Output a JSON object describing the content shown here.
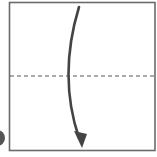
{
  "diagram": {
    "type": "origami-fold-step",
    "paper": {
      "shape": "square",
      "x": 9.5,
      "y": 2.5,
      "width": 145.5,
      "height": 148,
      "stroke": "#6b6b6b",
      "fill": "#ffffff"
    },
    "fold_line": {
      "style": "valley-dashed",
      "y": 76,
      "x1": 10,
      "x2": 155,
      "stroke": "#555555",
      "dash": "4 3"
    },
    "fold_arrow": {
      "direction": "top-to-bottom",
      "path": "M 79 7 Q 58 76 80 140",
      "stroke": "#444444",
      "head_tip": [
        81,
        147
      ]
    },
    "step_marker": {
      "partial": true,
      "cx": -3,
      "cy": 138,
      "r": 8,
      "fill": "#555555"
    }
  }
}
